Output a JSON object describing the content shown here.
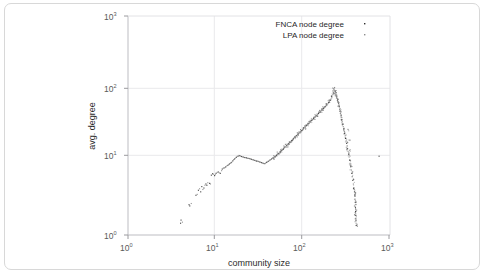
{
  "figure": {
    "background_color": "#ffffff",
    "border_color": "#d8d8d8"
  },
  "chart_data": {
    "type": "scatter",
    "title": "",
    "subtitle": "",
    "xlabel": "community size",
    "ylabel": "avg. degree",
    "xscale": "log",
    "yscale": "log",
    "xlim": [
      1,
      1000
    ],
    "ylim": [
      1,
      1000
    ],
    "grid": true,
    "xticks": [
      1,
      10,
      100,
      1000
    ],
    "xticklabels": [
      "10^0",
      "10^1",
      "10^2",
      "10^3"
    ],
    "yticks": [
      1,
      10,
      100,
      1000
    ],
    "yticklabels": [
      "10^0",
      "10^1",
      "10^2",
      "10^3"
    ],
    "legend_position": "upper right",
    "legend": [
      {
        "name": "FNCA node degree",
        "marker": "dot",
        "color": "#2e2e2e"
      },
      {
        "name": "LPA node degree",
        "marker": "dot",
        "color": "#8c8c8c"
      }
    ],
    "series": [
      {
        "name": "FNCA node degree",
        "color": "#2e2e2e",
        "points": [
          [
            4.0,
            1.45
          ],
          [
            4.05,
            1.6
          ],
          [
            5.0,
            2.6
          ],
          [
            5.1,
            2.5
          ],
          [
            6.0,
            3.5
          ],
          [
            6.4,
            4.1
          ],
          [
            6.8,
            3.9
          ],
          [
            7.0,
            4.6
          ],
          [
            7.4,
            4.4
          ],
          [
            7.8,
            5.0
          ],
          [
            8.0,
            4.8
          ],
          [
            8.6,
            5.1
          ],
          [
            9.0,
            6.6
          ],
          [
            9.3,
            6.9
          ],
          [
            9.8,
            6.5
          ],
          [
            10.2,
            7.0
          ],
          [
            10.8,
            7.3
          ],
          [
            11.4,
            7.0
          ],
          [
            12.0,
            8.0
          ],
          [
            12.6,
            8.3
          ],
          [
            13.2,
            8.6
          ],
          [
            13.9,
            9.0
          ],
          [
            14.5,
            9.4
          ],
          [
            15.2,
            9.8
          ],
          [
            15.9,
            10.4
          ],
          [
            16.6,
            11.0
          ],
          [
            17.4,
            11.6
          ],
          [
            18.2,
            12.0
          ],
          [
            19.0,
            12.2
          ],
          [
            19.9,
            11.9
          ],
          [
            20.8,
            11.7
          ],
          [
            21.7,
            11.5
          ],
          [
            22.7,
            11.4
          ],
          [
            23.7,
            11.2
          ],
          [
            24.8,
            11.1
          ],
          [
            25.9,
            10.9
          ],
          [
            27.1,
            10.7
          ],
          [
            28.3,
            10.5
          ],
          [
            29.6,
            10.3
          ],
          [
            30.9,
            10.2
          ],
          [
            32.3,
            10.0
          ],
          [
            33.8,
            9.8
          ],
          [
            35.3,
            9.6
          ],
          [
            36.9,
            9.5
          ],
          [
            38.6,
            9.9
          ],
          [
            40.3,
            10.2
          ],
          [
            42.1,
            10.6
          ],
          [
            44.0,
            11.0
          ],
          [
            46.0,
            11.4
          ],
          [
            48.1,
            11.8
          ],
          [
            50.3,
            12.4
          ],
          [
            52.6,
            13.0
          ],
          [
            55.0,
            13.7
          ],
          [
            57.5,
            14.4
          ],
          [
            60.1,
            15.2
          ],
          [
            62.8,
            16.0
          ],
          [
            65.6,
            16.9
          ],
          [
            68.6,
            17.8
          ],
          [
            71.7,
            18.7
          ],
          [
            74.9,
            19.7
          ],
          [
            78.3,
            20.8
          ],
          [
            81.8,
            21.9
          ],
          [
            85.5,
            23.1
          ],
          [
            89.4,
            24.3
          ],
          [
            93.4,
            25.6
          ],
          [
            97.6,
            27.0
          ],
          [
            102.0,
            28.5
          ],
          [
            106.6,
            30.0
          ],
          [
            111.4,
            31.7
          ],
          [
            116.4,
            33.4
          ],
          [
            121.7,
            35.2
          ],
          [
            127.2,
            37.2
          ],
          [
            132.9,
            39.2
          ],
          [
            138.9,
            41.4
          ],
          [
            145.2,
            43.7
          ],
          [
            151.7,
            46.1
          ],
          [
            158.5,
            48.7
          ],
          [
            165.7,
            51.4
          ],
          [
            173.1,
            54.3
          ],
          [
            180.9,
            57.4
          ],
          [
            189.0,
            60.8
          ],
          [
            197.5,
            64.8
          ],
          [
            206.4,
            70.0
          ],
          [
            215.7,
            78.0
          ],
          [
            225.4,
            88.0
          ],
          [
            228.0,
            100.0
          ],
          [
            235.6,
            92.0
          ],
          [
            240.0,
            85.0
          ],
          [
            246.2,
            78.0
          ],
          [
            252.0,
            71.0
          ],
          [
            257.3,
            64.0
          ],
          [
            262.9,
            57.0
          ],
          [
            268.9,
            50.0
          ],
          [
            275.0,
            44.0
          ],
          [
            281.5,
            38.0
          ],
          [
            288.3,
            33.0
          ],
          [
            295.4,
            28.5
          ],
          [
            302.8,
            24.5
          ],
          [
            310.5,
            21.0
          ],
          [
            318.6,
            18.0
          ],
          [
            327.0,
            15.2
          ],
          [
            335.8,
            12.8
          ],
          [
            345.0,
            10.6
          ],
          [
            354.6,
            8.6
          ],
          [
            364.6,
            7.0
          ],
          [
            375.0,
            5.6
          ],
          [
            385.9,
            4.4
          ],
          [
            392.0,
            3.9
          ],
          [
            397.0,
            3.4
          ],
          [
            400.0,
            2.8
          ],
          [
            402.0,
            2.4
          ],
          [
            404.0,
            2.1
          ],
          [
            406.0,
            1.85
          ],
          [
            408.0,
            1.6
          ],
          [
            410.0,
            1.35
          ],
          [
            750.0,
            12.0
          ]
        ]
      },
      {
        "name": "LPA node degree",
        "color": "#8c8c8c",
        "points": [
          [
            4.2,
            1.5
          ],
          [
            5.3,
            2.7
          ],
          [
            6.2,
            3.6
          ],
          [
            6.6,
            4.3
          ],
          [
            7.2,
            4.2
          ],
          [
            7.6,
            4.8
          ],
          [
            8.2,
            5.2
          ],
          [
            8.8,
            5.0
          ],
          [
            9.5,
            6.8
          ],
          [
            10.0,
            6.7
          ],
          [
            10.5,
            7.2
          ],
          [
            11.1,
            7.1
          ],
          [
            11.8,
            7.6
          ],
          [
            12.3,
            8.2
          ],
          [
            13.0,
            8.4
          ],
          [
            13.6,
            8.9
          ],
          [
            14.2,
            9.2
          ],
          [
            14.9,
            9.6
          ],
          [
            15.6,
            10.1
          ],
          [
            16.2,
            10.8
          ],
          [
            17.0,
            11.3
          ],
          [
            17.8,
            11.9
          ],
          [
            18.6,
            12.3
          ],
          [
            19.4,
            12.1
          ],
          [
            20.3,
            11.8
          ],
          [
            21.2,
            11.6
          ],
          [
            22.2,
            11.5
          ],
          [
            23.2,
            11.3
          ],
          [
            24.2,
            11.2
          ],
          [
            25.3,
            11.0
          ],
          [
            26.5,
            10.8
          ],
          [
            27.7,
            10.6
          ],
          [
            28.9,
            10.4
          ],
          [
            30.2,
            10.3
          ],
          [
            31.6,
            10.1
          ],
          [
            33.0,
            9.9
          ],
          [
            34.5,
            9.7
          ],
          [
            36.1,
            9.5
          ],
          [
            37.7,
            9.7
          ],
          [
            39.4,
            10.0
          ],
          [
            41.2,
            10.4
          ],
          [
            43.0,
            10.8
          ],
          [
            45.0,
            11.2
          ],
          [
            47.0,
            11.6
          ],
          [
            49.2,
            12.1
          ],
          [
            51.4,
            12.7
          ],
          [
            53.7,
            13.3
          ],
          [
            56.2,
            14.0
          ],
          [
            58.8,
            14.8
          ],
          [
            61.4,
            15.6
          ],
          [
            64.2,
            16.4
          ],
          [
            67.1,
            17.3
          ],
          [
            70.1,
            18.2
          ],
          [
            73.3,
            19.2
          ],
          [
            76.6,
            20.2
          ],
          [
            80.0,
            21.3
          ],
          [
            83.6,
            22.5
          ],
          [
            87.4,
            23.7
          ],
          [
            91.4,
            25.0
          ],
          [
            95.5,
            26.3
          ],
          [
            99.8,
            27.7
          ],
          [
            104.3,
            29.2
          ],
          [
            109.0,
            30.8
          ],
          [
            113.9,
            32.5
          ],
          [
            119.0,
            34.3
          ],
          [
            124.4,
            36.2
          ],
          [
            130.0,
            38.2
          ],
          [
            135.9,
            40.3
          ],
          [
            142.0,
            42.5
          ],
          [
            148.4,
            44.8
          ],
          [
            155.1,
            47.3
          ],
          [
            162.1,
            49.9
          ],
          [
            169.4,
            52.7
          ],
          [
            177.0,
            55.7
          ],
          [
            185.0,
            58.9
          ],
          [
            193.3,
            62.5
          ],
          [
            202.0,
            67.0
          ],
          [
            211.0,
            73.0
          ],
          [
            220.5,
            83.0
          ],
          [
            230.0,
            96.0
          ],
          [
            238.0,
            89.0
          ],
          [
            244.0,
            81.0
          ],
          [
            250.0,
            74.0
          ],
          [
            255.0,
            67.0
          ],
          [
            260.5,
            60.0
          ],
          [
            266.2,
            53.0
          ],
          [
            272.0,
            47.0
          ],
          [
            278.3,
            41.0
          ],
          [
            285.0,
            35.5
          ],
          [
            292.0,
            30.5
          ],
          [
            299.0,
            26.5
          ],
          [
            306.5,
            22.8
          ],
          [
            314.5,
            19.5
          ],
          [
            322.8,
            16.6
          ],
          [
            331.4,
            14.0
          ],
          [
            340.4,
            11.7
          ],
          [
            349.8,
            9.6
          ],
          [
            359.6,
            7.8
          ],
          [
            369.8,
            6.3
          ],
          [
            380.4,
            5.0
          ],
          [
            389.0,
            4.2
          ],
          [
            394.0,
            3.6
          ],
          [
            398.0,
            3.1
          ],
          [
            401.0,
            2.6
          ],
          [
            403.0,
            2.25
          ],
          [
            405.0,
            1.95
          ],
          [
            407.0,
            1.7
          ],
          [
            409.0,
            1.45
          ],
          [
            340.0,
            20.0
          ],
          [
            330.0,
            28.0
          ],
          [
            345.0,
            14.5
          ],
          [
            355.0,
            9.0
          ]
        ]
      }
    ]
  }
}
